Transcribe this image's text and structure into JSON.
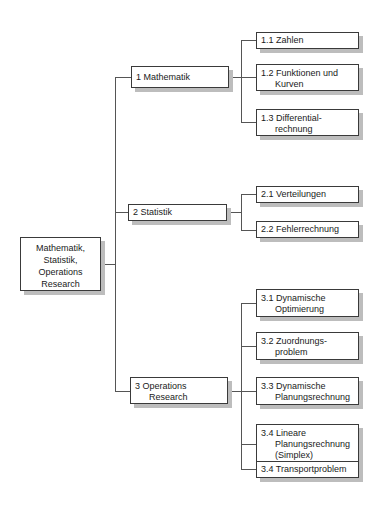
{
  "root": {
    "lines": [
      "Mathematik,",
      "Statistik,",
      "Operations",
      "Research"
    ]
  },
  "branches": [
    {
      "label": [
        "1 Mathematik"
      ],
      "children": [
        {
          "label": [
            "1.1 Zahlen"
          ]
        },
        {
          "label": [
            "1.2 Funktionen und",
            "Kurven"
          ]
        },
        {
          "label": [
            "1.3 Differential-",
            "rechnung"
          ]
        }
      ]
    },
    {
      "label": [
        "2 Statistik"
      ],
      "children": [
        {
          "label": [
            "2.1 Verteilungen"
          ]
        },
        {
          "label": [
            "2.2 Fehlerrechnung"
          ]
        }
      ]
    },
    {
      "label": [
        "3 Operations",
        "Research"
      ],
      "children": [
        {
          "label": [
            "3.1 Dynamische",
            "Optimierung"
          ]
        },
        {
          "label": [
            "3.2 Zuordnungs-",
            "problem"
          ]
        },
        {
          "label": [
            "3.3 Dynamische",
            "Planungsrechnung"
          ]
        },
        {
          "label": [
            "3.4 Lineare",
            "Planungsrechnung",
            "(Simplex)"
          ]
        },
        {
          "label": [
            "3.4 Transportproblem"
          ]
        }
      ]
    }
  ],
  "colors": {
    "line": "#555555",
    "border": "#3a3a3a",
    "shadow": "#bdbdbd"
  }
}
